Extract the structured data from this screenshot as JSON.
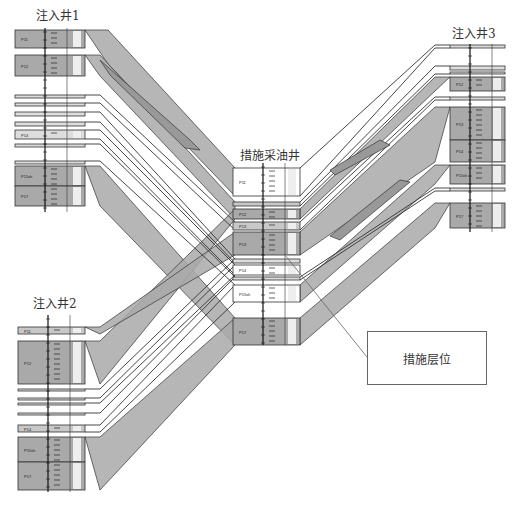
{
  "diagram": {
    "title_wells": [
      {
        "id": "inj1",
        "label": "注入井1",
        "x": 36,
        "y": 8
      },
      {
        "id": "inj3",
        "label": "注入井3",
        "x": 452,
        "y": 25
      },
      {
        "id": "prod",
        "label": "措施采油井",
        "x": 240,
        "y": 148
      },
      {
        "id": "inj2",
        "label": "注入井2",
        "x": 33,
        "y": 296
      }
    ],
    "callout": {
      "label": "措施层位",
      "x": 367,
      "y": 331,
      "w": 118,
      "h": 52,
      "leader": {
        "x1": 367,
        "y1": 357,
        "x2": 285,
        "y2": 255
      }
    },
    "colors": {
      "sand": "#a9a9a9",
      "sand_light": "#c8c8c8",
      "line": "#333333",
      "bg": "#ffffff",
      "lens": "#999999"
    },
    "wells": [
      {
        "id": "inj1",
        "x0": 15,
        "x1": 85,
        "axis_x": 45,
        "axis_y0": 28,
        "axis_y1": 212,
        "layers": [
          {
            "name": "P11",
            "y0": 30,
            "y1": 48,
            "fill": "sand",
            "depth": "1000"
          },
          {
            "name": "P12",
            "y0": 55,
            "y1": 76,
            "fill": "sand",
            "depth": "1090"
          },
          {
            "name": "P13",
            "y0": 95,
            "y1": 98,
            "fill": "thin",
            "depth": ""
          },
          {
            "name": "P13",
            "y0": 103,
            "y1": 106,
            "fill": "thin",
            "depth": ""
          },
          {
            "name": "P13",
            "y0": 112,
            "y1": 116,
            "fill": "thin",
            "depth": ""
          },
          {
            "name": "P14",
            "y0": 122,
            "y1": 126,
            "fill": "thin",
            "depth": ""
          },
          {
            "name": "P14",
            "y0": 130,
            "y1": 139,
            "fill": "thin",
            "depth": ""
          },
          {
            "name": "P15",
            "y0": 144,
            "y1": 147,
            "fill": "thin",
            "depth": ""
          },
          {
            "name": "P15sh",
            "y0": 161,
            "y1": 164,
            "fill": "thin",
            "depth": ""
          },
          {
            "name": "P15sh",
            "y0": 166,
            "y1": 186,
            "fill": "sand",
            "depth": ""
          },
          {
            "name": "P17",
            "y0": 186,
            "y1": 206,
            "fill": "sand",
            "depth": ""
          }
        ],
        "depth_ticks": [
          "1000",
          "1090",
          "1090",
          "1090",
          "1090"
        ]
      },
      {
        "id": "prod",
        "x0": 233,
        "x1": 300,
        "axis_x": 263,
        "axis_y0": 163,
        "axis_y1": 345,
        "layers": [
          {
            "name": "P11",
            "y0": 168,
            "y1": 196,
            "fill": "white",
            "depth": ""
          },
          {
            "name": "P12",
            "y0": 202,
            "y1": 206,
            "fill": "sand_light",
            "depth": ""
          },
          {
            "name": "P12",
            "y0": 209,
            "y1": 219,
            "fill": "sand",
            "depth": ""
          },
          {
            "name": "P13",
            "y0": 222,
            "y1": 230,
            "fill": "sand_light",
            "depth": ""
          },
          {
            "name": "P13",
            "y0": 232,
            "y1": 255,
            "fill": "sand",
            "depth": ""
          },
          {
            "name": "P14",
            "y0": 259,
            "y1": 263,
            "fill": "thin",
            "depth": ""
          },
          {
            "name": "P14",
            "y0": 265,
            "y1": 275,
            "fill": "white",
            "depth": ""
          },
          {
            "name": "P15",
            "y0": 277,
            "y1": 280,
            "fill": "thin",
            "depth": ""
          },
          {
            "name": "P15sh",
            "y0": 285,
            "y1": 302,
            "fill": "white",
            "depth": ""
          },
          {
            "name": "P17",
            "y0": 318,
            "y1": 345,
            "fill": "sand",
            "depth": ""
          }
        ]
      },
      {
        "id": "inj3",
        "x0": 450,
        "x1": 505,
        "axis_x": 470,
        "axis_y0": 44,
        "axis_y1": 232,
        "layers": [
          {
            "name": "P11",
            "y0": 45,
            "y1": 48,
            "fill": "thin",
            "depth": ""
          },
          {
            "name": "P12",
            "y0": 66,
            "y1": 70,
            "fill": "thin",
            "depth": ""
          },
          {
            "name": "P12",
            "y0": 72,
            "y1": 74,
            "fill": "thin",
            "depth": ""
          },
          {
            "name": "P12",
            "y0": 77,
            "y1": 91,
            "fill": "sand",
            "depth": ""
          },
          {
            "name": "P13",
            "y0": 97,
            "y1": 100,
            "fill": "thin",
            "depth": ""
          },
          {
            "name": "P13",
            "y0": 107,
            "y1": 140,
            "fill": "sand",
            "depth": ""
          },
          {
            "name": "P14",
            "y0": 140,
            "y1": 162,
            "fill": "sand",
            "depth": ""
          },
          {
            "name": "P15sh",
            "y0": 165,
            "y1": 184,
            "fill": "sand",
            "depth": ""
          },
          {
            "name": "P15sh",
            "y0": 188,
            "y1": 191,
            "fill": "thin",
            "depth": ""
          },
          {
            "name": "P17",
            "y0": 203,
            "y1": 228,
            "fill": "sand",
            "depth": ""
          }
        ]
      },
      {
        "id": "inj2",
        "x0": 18,
        "x1": 85,
        "axis_x": 48,
        "axis_y0": 315,
        "axis_y1": 492,
        "layers": [
          {
            "name": "P11",
            "y0": 327,
            "y1": 334,
            "fill": "sand_light",
            "depth": ""
          },
          {
            "name": "P12",
            "y0": 341,
            "y1": 384,
            "fill": "sand",
            "depth": ""
          },
          {
            "name": "P13",
            "y0": 389,
            "y1": 391,
            "fill": "thin",
            "depth": ""
          },
          {
            "name": "P13",
            "y0": 398,
            "y1": 400,
            "fill": "thin",
            "depth": ""
          },
          {
            "name": "P14",
            "y0": 403,
            "y1": 405,
            "fill": "thin",
            "depth": ""
          },
          {
            "name": "P14",
            "y0": 413,
            "y1": 415,
            "fill": "thin",
            "depth": ""
          },
          {
            "name": "P14",
            "y0": 425,
            "y1": 432,
            "fill": "sand_light",
            "depth": ""
          },
          {
            "name": "P15sh",
            "y0": 437,
            "y1": 462,
            "fill": "sand",
            "depth": ""
          },
          {
            "name": "P17",
            "y0": 462,
            "y1": 490,
            "fill": "sand",
            "depth": ""
          }
        ]
      }
    ],
    "bands": [
      {
        "from": "inj1",
        "to": "prod",
        "fill": "sand",
        "pts": [
          [
            85,
            30
          ],
          [
            108,
            30
          ],
          [
            235,
            168
          ],
          [
            235,
            196
          ],
          [
            108,
            64
          ]
        ]
      },
      {
        "from": "inj1",
        "to": "prod",
        "fill": "sand",
        "pts": [
          [
            85,
            55
          ],
          [
            100,
            55
          ],
          [
            235,
            202
          ],
          [
            235,
            219
          ],
          [
            100,
            76
          ]
        ]
      },
      {
        "from": "inj1",
        "to": "prod",
        "fill": "sand",
        "pts": [
          [
            85,
            166
          ],
          [
            100,
            166
          ],
          [
            235,
            318
          ],
          [
            235,
            345
          ],
          [
            100,
            206
          ]
        ]
      },
      {
        "from": "inj2",
        "to": "prod",
        "fill": "sand",
        "pts": [
          [
            85,
            341
          ],
          [
            100,
            341
          ],
          [
            235,
            209
          ],
          [
            235,
            219
          ],
          [
            100,
            384
          ]
        ]
      },
      {
        "from": "inj2",
        "to": "prod",
        "fill": "sand",
        "pts": [
          [
            85,
            437
          ],
          [
            100,
            437
          ],
          [
            235,
            318
          ],
          [
            235,
            345
          ],
          [
            100,
            490
          ]
        ]
      },
      {
        "from": "inj2",
        "to": "prod",
        "fill": "sand",
        "pts": [
          [
            85,
            327
          ],
          [
            100,
            327
          ],
          [
            235,
            232
          ],
          [
            235,
            255
          ],
          [
            100,
            334
          ]
        ]
      },
      {
        "from": "inj3",
        "to": "prod",
        "fill": "sand",
        "pts": [
          [
            450,
            77
          ],
          [
            435,
            77
          ],
          [
            300,
            209
          ],
          [
            300,
            219
          ],
          [
            435,
            91
          ]
        ]
      },
      {
        "from": "inj3",
        "to": "prod",
        "fill": "sand",
        "pts": [
          [
            450,
            107
          ],
          [
            435,
            107
          ],
          [
            300,
            232
          ],
          [
            300,
            255
          ],
          [
            435,
            162
          ]
        ]
      },
      {
        "from": "inj3",
        "to": "prod",
        "fill": "sand",
        "pts": [
          [
            450,
            165
          ],
          [
            435,
            165
          ],
          [
            300,
            285
          ],
          [
            300,
            302
          ],
          [
            435,
            184
          ]
        ]
      },
      {
        "from": "inj3",
        "to": "prod",
        "fill": "sand",
        "pts": [
          [
            450,
            203
          ],
          [
            435,
            203
          ],
          [
            300,
            318
          ],
          [
            300,
            345
          ],
          [
            435,
            228
          ]
        ]
      }
    ],
    "line_pairs": [
      [
        [
          85,
          95
        ],
        [
          100,
          95
        ],
        [
          235,
          222
        ]
      ],
      [
        [
          85,
          103
        ],
        [
          100,
          103
        ],
        [
          235,
          230
        ]
      ],
      [
        [
          85,
          112
        ],
        [
          100,
          112
        ],
        [
          235,
          259
        ]
      ],
      [
        [
          85,
          122
        ],
        [
          100,
          122
        ],
        [
          235,
          263
        ]
      ],
      [
        [
          85,
          130
        ],
        [
          100,
          130
        ],
        [
          235,
          265
        ]
      ],
      [
        [
          85,
          139
        ],
        [
          100,
          139
        ],
        [
          235,
          275
        ]
      ],
      [
        [
          85,
          144
        ],
        [
          100,
          144
        ],
        [
          235,
          277
        ]
      ],
      [
        [
          85,
          161
        ],
        [
          100,
          161
        ],
        [
          235,
          285
        ]
      ],
      [
        [
          85,
          389
        ],
        [
          100,
          389
        ],
        [
          235,
          259
        ]
      ],
      [
        [
          85,
          398
        ],
        [
          100,
          398
        ],
        [
          235,
          265
        ]
      ],
      [
        [
          85,
          403
        ],
        [
          100,
          403
        ],
        [
          235,
          275
        ]
      ],
      [
        [
          85,
          413
        ],
        [
          100,
          413
        ],
        [
          235,
          277
        ]
      ],
      [
        [
          85,
          425
        ],
        [
          100,
          425
        ],
        [
          235,
          285
        ]
      ],
      [
        [
          85,
          432
        ],
        [
          100,
          432
        ],
        [
          235,
          302
        ]
      ],
      [
        [
          450,
          45
        ],
        [
          435,
          45
        ],
        [
          300,
          168
        ]
      ],
      [
        [
          450,
          48
        ],
        [
          435,
          48
        ],
        [
          300,
          196
        ]
      ],
      [
        [
          450,
          66
        ],
        [
          435,
          66
        ],
        [
          300,
          202
        ]
      ],
      [
        [
          450,
          74
        ],
        [
          435,
          74
        ],
        [
          300,
          206
        ]
      ],
      [
        [
          450,
          97
        ],
        [
          435,
          97
        ],
        [
          300,
          222
        ]
      ],
      [
        [
          450,
          100
        ],
        [
          435,
          100
        ],
        [
          300,
          230
        ]
      ],
      [
        [
          450,
          188
        ],
        [
          435,
          188
        ],
        [
          300,
          277
        ]
      ],
      [
        [
          450,
          191
        ],
        [
          435,
          191
        ],
        [
          300,
          280
        ]
      ]
    ],
    "lenses": [
      {
        "pts": [
          [
            100,
            60
          ],
          [
            190,
            140
          ],
          [
            200,
            150
          ],
          [
            185,
            148
          ],
          [
            110,
            75
          ]
        ]
      },
      {
        "pts": [
          [
            330,
            236
          ],
          [
            400,
            180
          ],
          [
            410,
            182
          ],
          [
            340,
            240
          ]
        ]
      },
      {
        "pts": [
          [
            330,
            170
          ],
          [
            380,
            140
          ],
          [
            390,
            145
          ],
          [
            335,
            175
          ]
        ]
      }
    ]
  }
}
